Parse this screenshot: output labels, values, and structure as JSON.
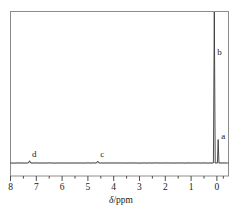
{
  "figure": {
    "kind": "nmr-spectrum",
    "background_color": "#ffffff",
    "line_color": "#3a3a3a",
    "text_color": "#1a1a1a"
  },
  "axis": {
    "title_delta": "δ",
    "title_unit": "/ppm",
    "tick_labels": [
      "8",
      "7",
      "6",
      "5",
      "4",
      "3",
      "2",
      "1",
      "0"
    ],
    "minor_ticks_per_interval": 1
  },
  "peak_labels": [
    {
      "name": "a",
      "text": "a"
    },
    {
      "name": "b",
      "text": "b"
    },
    {
      "name": "c",
      "text": "c"
    },
    {
      "name": "d",
      "text": "d"
    }
  ],
  "chart_data": {
    "type": "line",
    "title": "",
    "xlabel": "δ/ppm",
    "ylabel": "",
    "xlim": [
      8.0,
      -0.45
    ],
    "ylim": [
      0,
      1.0
    ],
    "x_reversed": true,
    "grid": false,
    "legend": "none",
    "x_ticks": [
      8,
      7,
      6,
      5,
      4,
      3,
      2,
      1,
      0
    ],
    "x_minor_ticks": [
      7.5,
      6.5,
      5.5,
      4.5,
      3.5,
      2.5,
      1.5,
      0.5,
      -0.25
    ],
    "baseline_y": 0.0,
    "annotations": [
      {
        "label": "d",
        "x": 7.26,
        "y": 0.02
      },
      {
        "label": "c",
        "x": 4.62,
        "y": 0.02
      },
      {
        "label": "b",
        "x": 0.1,
        "y": 0.72
      },
      {
        "label": "a",
        "x": -0.05,
        "y": 0.14
      }
    ],
    "series": [
      {
        "name": "1H NMR trace",
        "peaks": [
          {
            "label": "d",
            "center_ppm": 7.26,
            "height": 0.015,
            "width_ppm": 0.05
          },
          {
            "label": "c",
            "center_ppm": 4.62,
            "height": 0.013,
            "width_ppm": 0.05
          },
          {
            "label": "b",
            "center_ppm": 0.1,
            "height": 1.0,
            "width_ppm": 0.035
          },
          {
            "label": "a",
            "center_ppm": -0.05,
            "height": 0.155,
            "width_ppm": 0.03
          }
        ]
      }
    ]
  }
}
